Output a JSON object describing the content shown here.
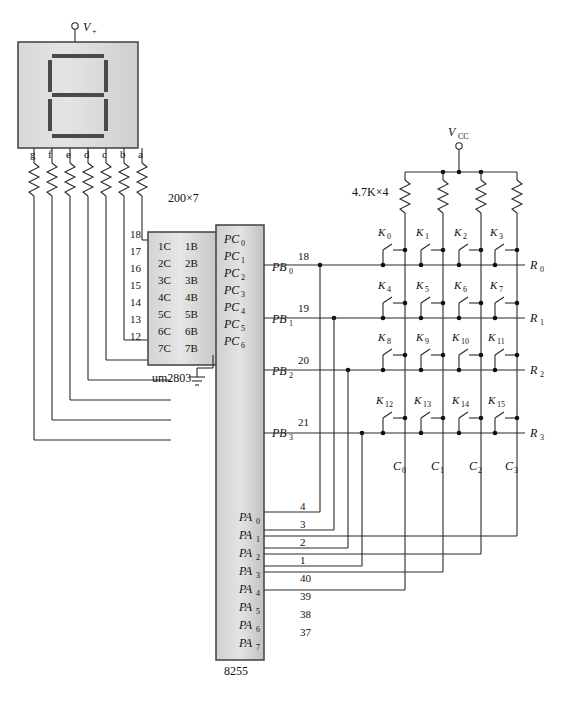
{
  "diagram": {
    "title_parts": {
      "driver_chip": "um2803",
      "controller_chip": "8255"
    },
    "supply_display": "V",
    "supply_display_sub": "+",
    "supply_keypad": "V",
    "supply_keypad_sub": "CC",
    "resistor_display_label": "200×7",
    "resistor_keypad_label": "4.7K×4"
  },
  "display": {
    "name": "seven-segment-display",
    "segment_labels": [
      "g",
      "f",
      "e",
      "d",
      "c",
      "b",
      "a"
    ]
  },
  "driver": {
    "name": "um2803",
    "label": "um2803",
    "input_pins": [
      "18",
      "17",
      "16",
      "15",
      "14",
      "13",
      "12"
    ],
    "output_pins": [
      "1",
      "2",
      "3",
      "4",
      "5",
      "6",
      "7"
    ],
    "ground_pin": "9",
    "rows": [
      {
        "in": "1C",
        "out": "1B"
      },
      {
        "in": "2C",
        "out": "2B"
      },
      {
        "in": "3C",
        "out": "3B"
      },
      {
        "in": "4C",
        "out": "4B"
      },
      {
        "in": "5C",
        "out": "5B"
      },
      {
        "in": "6C",
        "out": "6B"
      },
      {
        "in": "7C",
        "out": "7B"
      }
    ]
  },
  "controller": {
    "name": "8255",
    "label": "8255",
    "port_c": [
      {
        "label": "PC",
        "sub": "0"
      },
      {
        "label": "PC",
        "sub": "1"
      },
      {
        "label": "PC",
        "sub": "2"
      },
      {
        "label": "PC",
        "sub": "3"
      },
      {
        "label": "PC",
        "sub": "4"
      },
      {
        "label": "PC",
        "sub": "5"
      },
      {
        "label": "PC",
        "sub": "6"
      }
    ],
    "port_b": [
      {
        "label": "PB",
        "sub": "0",
        "pin": "18"
      },
      {
        "label": "PB",
        "sub": "1",
        "pin": "19"
      },
      {
        "label": "PB",
        "sub": "2",
        "pin": "20"
      },
      {
        "label": "PB",
        "sub": "3",
        "pin": "21"
      }
    ],
    "port_a": [
      {
        "label": "PA",
        "sub": "0",
        "pin": "4"
      },
      {
        "label": "PA",
        "sub": "1",
        "pin": "3"
      },
      {
        "label": "PA",
        "sub": "2",
        "pin": "2"
      },
      {
        "label": "PA",
        "sub": "3",
        "pin": "1"
      },
      {
        "label": "PA",
        "sub": "4",
        "pin": "40"
      },
      {
        "label": "PA",
        "sub": "5",
        "pin": "39"
      },
      {
        "label": "PA",
        "sub": "6",
        "pin": "38"
      },
      {
        "label": "PA",
        "sub": "7",
        "pin": "37"
      }
    ]
  },
  "keypad": {
    "name": "key-matrix-4x4",
    "keys": [
      {
        "label": "K",
        "sub": "0"
      },
      {
        "label": "K",
        "sub": "1"
      },
      {
        "label": "K",
        "sub": "2"
      },
      {
        "label": "K",
        "sub": "3"
      },
      {
        "label": "K",
        "sub": "4"
      },
      {
        "label": "K",
        "sub": "5"
      },
      {
        "label": "K",
        "sub": "6"
      },
      {
        "label": "K",
        "sub": "7"
      },
      {
        "label": "K",
        "sub": "8"
      },
      {
        "label": "K",
        "sub": "9"
      },
      {
        "label": "K",
        "sub": "10"
      },
      {
        "label": "K",
        "sub": "11"
      },
      {
        "label": "K",
        "sub": "12"
      },
      {
        "label": "K",
        "sub": "13"
      },
      {
        "label": "K",
        "sub": "14"
      },
      {
        "label": "K",
        "sub": "15"
      }
    ],
    "rows": [
      {
        "label": "R",
        "sub": "0"
      },
      {
        "label": "R",
        "sub": "1"
      },
      {
        "label": "R",
        "sub": "2"
      },
      {
        "label": "R",
        "sub": "3"
      }
    ],
    "columns": [
      {
        "label": "C",
        "sub": "0"
      },
      {
        "label": "C",
        "sub": "1"
      },
      {
        "label": "C",
        "sub": "2"
      },
      {
        "label": "C",
        "sub": "3"
      }
    ]
  },
  "colors": {
    "wire": "#2a2a2a",
    "chip_fill_light": "#e2e2e2",
    "chip_fill_dark": "#c9c9c9",
    "chip_border": "#4a4a4a",
    "segment": "#4a4a4a",
    "text": "#111111"
  }
}
